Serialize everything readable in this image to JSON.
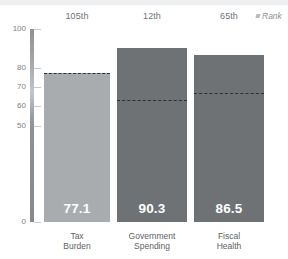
{
  "legend": {
    "rank_label": "Rank",
    "marker_name": "rank-tick-marker"
  },
  "axis": {
    "y_ticks": [
      {
        "value": 100,
        "label": "100"
      },
      {
        "value": 80,
        "label": "80"
      },
      {
        "value": 70,
        "label": "70"
      },
      {
        "value": 60,
        "label": "60"
      },
      {
        "value": 50,
        "label": "50"
      },
      {
        "value": 0,
        "label": "0"
      }
    ],
    "y_min": 0,
    "y_max": 100
  },
  "colors": {
    "bar_light": "#a9acae",
    "bar_dark": "#6e7275",
    "dash_line": "#2c2f33",
    "value_text": "#ffffff",
    "axis_text": "#7d8084",
    "rank_text": "#6f7276",
    "category_text": "#5e6164",
    "background": "#ffffff",
    "top_strip": "#eceeef"
  },
  "chart_data": {
    "type": "bar",
    "title": "",
    "xlabel": "",
    "ylabel": "",
    "ylim": [
      0,
      100
    ],
    "grid": false,
    "legend_position": "top-right",
    "categories": [
      "Tax\nBurden",
      "Government\nSpending",
      "Fiscal\nHealth"
    ],
    "values": [
      77.1,
      90.3,
      86.5
    ],
    "value_labels": [
      "77.1",
      "90.3",
      "86.5"
    ],
    "ranks": [
      "105th",
      "12th",
      "65th"
    ],
    "reference_lines": [
      77.1,
      63.0,
      67.0
    ],
    "bar_colors": [
      "#a9acae",
      "#6e7275",
      "#6e7275"
    ],
    "series": [
      {
        "name": "Score",
        "values": [
          77.1,
          90.3,
          86.5
        ]
      },
      {
        "name": "Reference (dashed)",
        "values": [
          77.1,
          63.0,
          67.0
        ]
      }
    ]
  }
}
